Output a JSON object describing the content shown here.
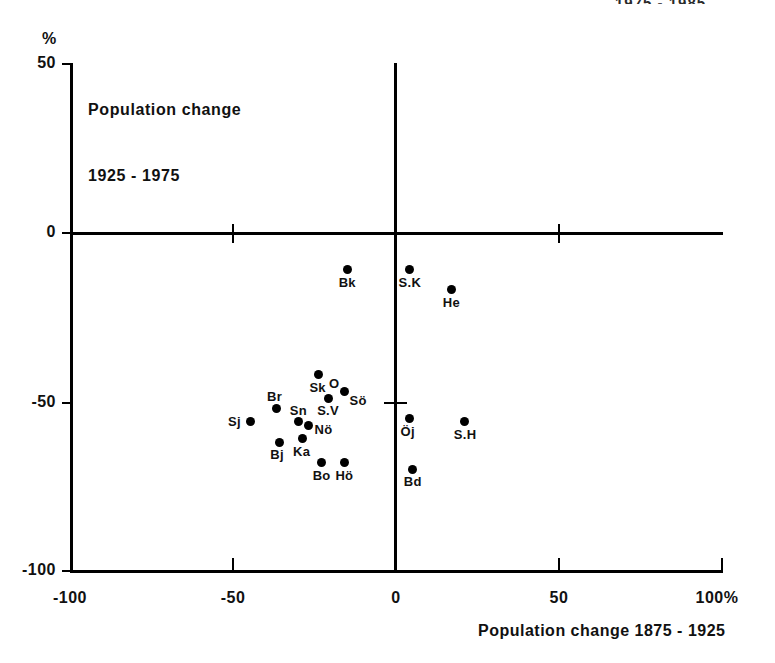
{
  "clipped_header": "1975 - 1985",
  "plot": {
    "title_line1": "Population change",
    "title_line2": "1925 - 1975",
    "y_unit": "%",
    "x_axis_title": "Population change 1875 - 1925"
  },
  "axes": {
    "y_ticks": [
      "50",
      "0",
      "-50",
      "-100"
    ],
    "x_ticks": [
      "-100",
      "-50",
      "0",
      "50",
      "100%"
    ]
  },
  "chart_data": {
    "type": "scatter",
    "title": "Population change 1925 - 1975",
    "xlabel": "Population change 1875 - 1925",
    "ylabel": "Population change 1925 - 1975 (%)",
    "xlim": [
      -100,
      100
    ],
    "ylim": [
      -100,
      50
    ],
    "xticks": [
      -100,
      -50,
      0,
      50,
      100
    ],
    "yticks": [
      50,
      0,
      -50,
      -100
    ],
    "grid": false,
    "legend": "none",
    "x_unit": "%",
    "y_unit": "%",
    "reference_lines": {
      "x": 0,
      "y": 0
    },
    "points": [
      {
        "label": "Bk",
        "x": -15,
        "y": -11
      },
      {
        "label": "S.K",
        "x": 4,
        "y": -11
      },
      {
        "label": "He",
        "x": 17,
        "y": -17
      },
      {
        "label": "Sk",
        "x": -24,
        "y": -42
      },
      {
        "label": "O",
        "x": -18,
        "y": -48
      },
      {
        "label": "Sö",
        "x": -16,
        "y": -47
      },
      {
        "label": "S.V",
        "x": -21,
        "y": -49
      },
      {
        "label": "Br",
        "x": -37,
        "y": -52
      },
      {
        "label": "Sn",
        "x": -30,
        "y": -56
      },
      {
        "label": "Sj",
        "x": -45,
        "y": -56
      },
      {
        "label": "Nö",
        "x": -27,
        "y": -57
      },
      {
        "label": "Öj",
        "x": 4,
        "y": -55
      },
      {
        "label": "S.H",
        "x": 21,
        "y": -56
      },
      {
        "label": "Ka",
        "x": -29,
        "y": -61
      },
      {
        "label": "Bj",
        "x": -36,
        "y": -62
      },
      {
        "label": "Bo",
        "x": -23,
        "y": -68
      },
      {
        "label": "Hö",
        "x": -16,
        "y": -68
      },
      {
        "label": "Bd",
        "x": 5,
        "y": -70
      }
    ]
  }
}
